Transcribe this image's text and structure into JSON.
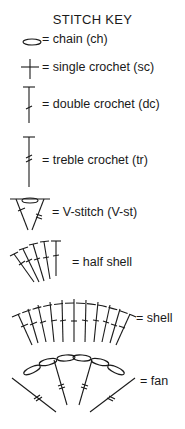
{
  "title": "STITCH KEY",
  "entries": [
    {
      "symbol": "chain-symbol-icon",
      "label": "= chain (ch)"
    },
    {
      "symbol": "single-crochet-symbol-icon",
      "label": "= single crochet (sc)"
    },
    {
      "symbol": "double-crochet-symbol-icon",
      "label": "= double crochet (dc)"
    },
    {
      "symbol": "treble-crochet-symbol-icon",
      "label": "= treble crochet (tr)"
    },
    {
      "symbol": "v-stitch-symbol-icon",
      "label": "= V-stitch (V-st)"
    },
    {
      "symbol": "half-shell-symbol-icon",
      "label": "= half shell"
    },
    {
      "symbol": "shell-symbol-icon",
      "label": "= shell"
    },
    {
      "symbol": "fan-symbol-icon",
      "label": "= fan"
    }
  ],
  "colors": {
    "ink": "#1a1a1a",
    "background": "#ffffff"
  }
}
